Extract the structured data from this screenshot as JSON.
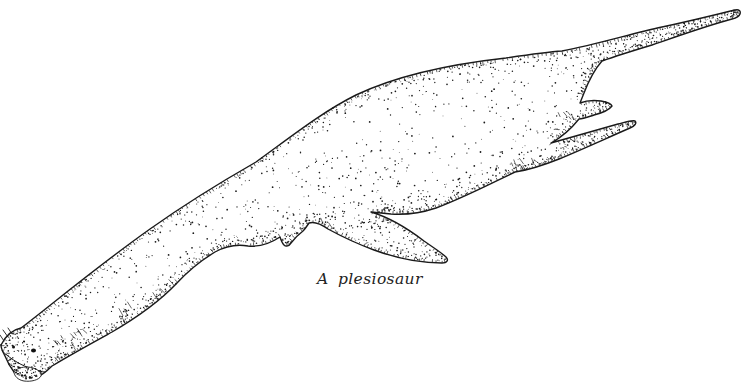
{
  "figure": {
    "caption": "A plesiosaur",
    "ink_color": "#1a1a1a",
    "paper_color": "#ffffff"
  }
}
